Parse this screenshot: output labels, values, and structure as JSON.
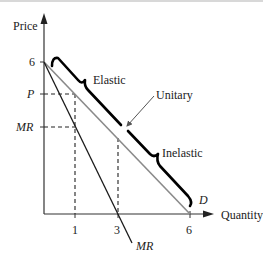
{
  "diagram": {
    "axes": {
      "y_label": "Price",
      "x_label": "Quantity",
      "y_ticks": [
        "6",
        "P",
        "MR"
      ],
      "x_ticks": [
        "1",
        "3",
        "6"
      ]
    },
    "curves": {
      "demand_label": "D",
      "mr_label": "MR"
    },
    "regions": {
      "elastic": "Elastic",
      "unitary": "Unitary",
      "inelastic": "Inelastic"
    },
    "colors": {
      "demand": "#8a8a8a",
      "mr": "#1a1a1a",
      "bracket": "#000000",
      "axis": "#333333"
    }
  }
}
